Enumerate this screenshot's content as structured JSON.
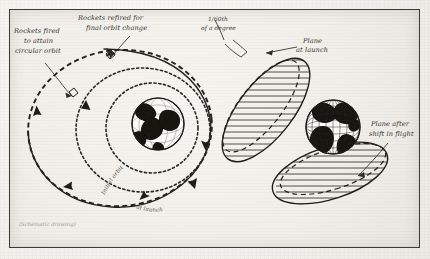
{
  "figure": {
    "kind": "schematic-diagram",
    "background_color": "#f1efe9",
    "ink_color": "#23221f",
    "frame_color": "#3b3a36"
  },
  "annotations": {
    "rockets_fired": "Rockets fired\nto attain\ncircular orbit",
    "rockets_fired_lines": [
      "Rockets fired",
      "to attain",
      "circular orbit"
    ],
    "rockets_refired_lines": [
      "Rockets refired for",
      "final orbit change"
    ],
    "degree_lines": [
      "1/60th",
      "of a degree"
    ],
    "plane_at_launch_lines": [
      "Plane",
      "at launch"
    ],
    "plane_after_shift_lines": [
      "Plane after",
      "shift in flight"
    ],
    "orbit_curve_label": "Initial orbit",
    "orbit_curve_label_2": "at launch",
    "caption": "(Schematic drawing)"
  },
  "left_panel": {
    "name": "orbit-insertion-view",
    "globe_label": "earth-globe",
    "paths": [
      "transfer-ellipse",
      "circular-orbit",
      "final-orbit"
    ]
  },
  "right_panel": {
    "name": "orbital-plane-shift-view",
    "globe_label": "earth-globe-graticule",
    "planes": [
      "plane-at-launch",
      "plane-after-shift"
    ]
  },
  "colors": {
    "paper": "#f1efe9",
    "ink": "#23221f",
    "faint_ink": "#8d8a83",
    "frame": "#3b3a36"
  }
}
